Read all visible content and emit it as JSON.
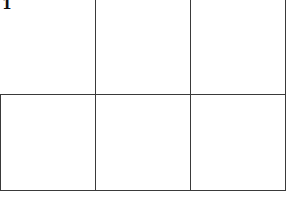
{
  "diagram": {
    "label": "1",
    "grid": {
      "rows": 2,
      "cols": 3,
      "line_color": "#3a3a3a",
      "top_row_first_cell_open": true
    }
  }
}
